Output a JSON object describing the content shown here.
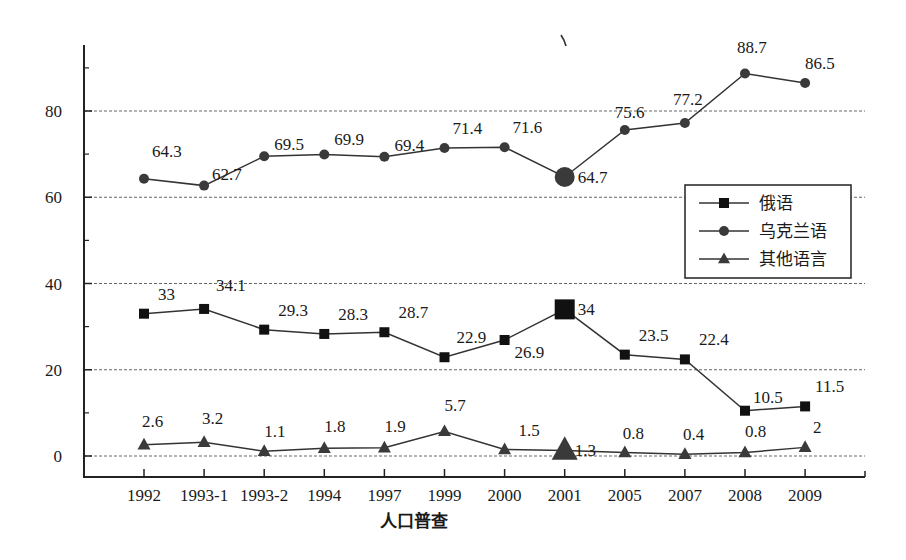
{
  "chart_data": {
    "type": "line",
    "title": "",
    "xlabel": "人口普查",
    "ylabel": "",
    "ylim": [
      0,
      100
    ],
    "yticks": [
      0,
      20,
      40,
      60,
      80
    ],
    "minor_yticks": [
      10,
      30,
      50,
      70,
      90
    ],
    "grid": true,
    "legend_position": "right-middle",
    "categories": [
      "1992",
      "1993-1",
      "1993-2",
      "1994",
      "1997",
      "1999",
      "2000",
      "2001",
      "2005",
      "2007",
      "2008",
      "2009"
    ],
    "series": [
      {
        "name": "俄语",
        "marker": "square",
        "color": "#111111",
        "values": [
          33,
          34.1,
          29.3,
          28.3,
          28.7,
          22.9,
          26.9,
          34,
          23.5,
          22.4,
          10.5,
          11.5
        ],
        "labels": [
          "33",
          "34.1",
          "29.3",
          "28.3",
          "28.7",
          "22.9",
          "26.9",
          "34",
          "23.5",
          "22.4",
          "10.5",
          "11.5"
        ],
        "highlight_index": 7
      },
      {
        "name": "乌克兰语",
        "marker": "circle",
        "color": "#3a3a3a",
        "values": [
          64.3,
          62.7,
          69.5,
          69.9,
          69.4,
          71.4,
          71.6,
          64.7,
          75.6,
          77.2,
          88.7,
          86.5
        ],
        "labels": [
          "64.3",
          "62.7",
          "69.5",
          "69.9",
          "69.4",
          "71.4",
          "71.6",
          "64.7",
          "75.6",
          "77.2",
          "88.7",
          "86.5"
        ],
        "highlight_index": 7
      },
      {
        "name": "其他语言",
        "marker": "triangle",
        "color": "#3a3a3a",
        "values": [
          2.6,
          3.2,
          1.1,
          1.8,
          1.9,
          5.7,
          1.5,
          1.3,
          0.8,
          0.4,
          0.8,
          2
        ],
        "labels": [
          "2.6",
          "3.2",
          "1.1",
          "1.8",
          "1.9",
          "5.7",
          "1.5",
          "1.3",
          "0.8",
          "0.4",
          "0.8",
          "2"
        ],
        "highlight_index": 7
      }
    ]
  }
}
